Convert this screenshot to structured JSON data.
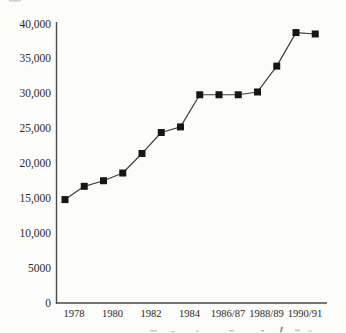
{
  "figure": {
    "background": "#fcfcfa"
  },
  "chart_data": {
    "type": "line",
    "title": "",
    "xlabel": "",
    "ylabel": "",
    "x": [
      "1978",
      "1979",
      "1980",
      "1981",
      "1982",
      "1983",
      "1984",
      "1985",
      "1986",
      "1987",
      "1988",
      "1989",
      "1990",
      "1991"
    ],
    "values": [
      14800,
      16700,
      17500,
      18600,
      21400,
      24400,
      25200,
      29800,
      29800,
      29800,
      30200,
      33900,
      38700,
      38500
    ],
    "x_tick_labels": [
      "1978",
      "1980",
      "1982",
      "1984",
      "1986/87",
      "1988/89",
      "1990/91"
    ],
    "x_tick_point_indices": [
      0,
      2,
      4,
      6,
      8,
      10,
      12
    ],
    "y_ticks": [
      0,
      5000,
      10000,
      15000,
      20000,
      25000,
      30000,
      35000,
      40000
    ],
    "y_tick_labels": [
      "0",
      "5000",
      "10,000",
      "15,000",
      "20,000",
      "25,000",
      "30,000",
      "35,000",
      "40,000"
    ],
    "ylim": [
      0,
      40000
    ],
    "grid": false,
    "legend": false,
    "marker": "square",
    "marker_size": 7,
    "colors": {
      "line": "#3f3f3c",
      "marker": "#161613",
      "axis": "#4a4a46",
      "text": "#2b2b27"
    }
  }
}
